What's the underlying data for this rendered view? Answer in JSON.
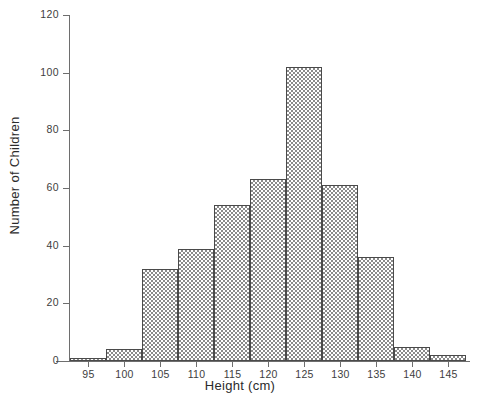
{
  "chart_data": {
    "type": "bar",
    "title": "",
    "subtitle": "",
    "xlabel": "Height (cm)",
    "ylabel": "Number of Children",
    "xlim": [
      92.5,
      147.5
    ],
    "ylim": [
      0,
      120
    ],
    "grid": false,
    "legend": null,
    "bin_width": 5,
    "bin_edges": [
      92.5,
      97.5,
      102.5,
      107.5,
      112.5,
      117.5,
      122.5,
      127.5,
      132.5,
      137.5,
      142.5,
      147.5
    ],
    "categories": [
      "92.5-97.5",
      "97.5-102.5",
      "102.5-107.5",
      "107.5-112.5",
      "112.5-117.5",
      "117.5-122.5",
      "122.5-127.5",
      "127.5-132.5",
      "132.5-137.5",
      "137.5-142.5",
      "142.5-147.5"
    ],
    "values": [
      1,
      4,
      32,
      39,
      54,
      63,
      102,
      61,
      36,
      5,
      2
    ],
    "xticks": [
      95,
      100,
      105,
      110,
      115,
      120,
      125,
      130,
      135,
      140,
      145
    ],
    "xticklabels": [
      "95",
      "100",
      "105",
      "110",
      "115",
      "120",
      "125",
      "130",
      "135",
      "140",
      "145"
    ],
    "yticks": [
      0,
      20,
      40,
      60,
      80,
      100,
      120
    ],
    "yticklabels": [
      "0",
      "20",
      "40",
      "60",
      "80",
      "100",
      "120"
    ],
    "colors": {
      "bar_fill": "#8a8a8a",
      "bar_edge": "#4a4a4a",
      "axis": "#6e6e6e",
      "text": "#2b2b2b",
      "background": "#ffffff"
    }
  }
}
